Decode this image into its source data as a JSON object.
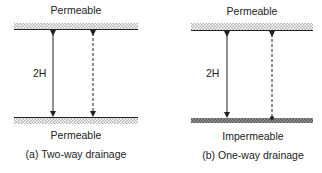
{
  "panels": [
    {
      "id": "a",
      "top_boundary": "Permeable",
      "bottom_boundary": "Permeable",
      "thickness_label": "2H",
      "caption": "(a) Two-way drainage"
    },
    {
      "id": "b",
      "top_boundary": "Permeable",
      "bottom_boundary": "Impermeable",
      "thickness_label": "2H",
      "caption": "(b) One-way drainage"
    }
  ],
  "colors": {
    "line": "#222222",
    "permeable_fill": "#c8c8c8",
    "impermeable_fill": "#777777"
  }
}
